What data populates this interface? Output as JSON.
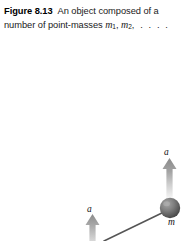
{
  "caption": {
    "figure_label": "Figure 8.13",
    "text_before_symbols": "An object composed of a number of point-masses ",
    "mass_symbol": "m",
    "subscript_1": "1",
    "subscript_2": "2",
    "separator": ", ",
    "trailing": ", . . . ."
  },
  "figure": {
    "acceleration_label_right": "a",
    "acceleration_label_left": "a",
    "mass_label": "m",
    "colors": {
      "arrow_top": "#8c8c8c",
      "arrow_bottom": "#fbfbfb",
      "sphere_light": "#9a9a9a",
      "sphere_dark": "#4a4a4a",
      "rod": "#4f4f4f",
      "background": "#ffffff",
      "text": "#111111"
    },
    "elements": [
      {
        "name": "acceleration-arrow-right",
        "type": "block-arrow",
        "direction": "up",
        "x": 165,
        "y_top": 158,
        "y_bottom": 200
      },
      {
        "name": "acceleration-arrow-left",
        "type": "block-arrow",
        "direction": "up",
        "x": 92,
        "y_top": 214,
        "y_bottom": 241
      },
      {
        "name": "point-mass-sphere",
        "type": "sphere",
        "cx": 170,
        "cy": 208,
        "r": 10
      },
      {
        "name": "connecting-rod",
        "type": "line",
        "x1": 163,
        "y1": 213,
        "x2": 108,
        "y2": 241
      }
    ]
  }
}
